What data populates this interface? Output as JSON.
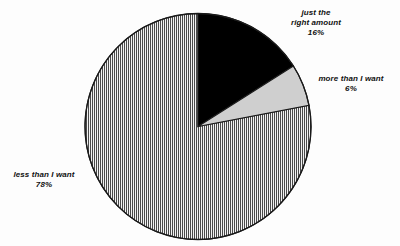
{
  "chart_data": {
    "type": "pie",
    "title": "",
    "subtitle": "",
    "xlabel": "",
    "ylabel": "",
    "legend_position": "none",
    "grid": false,
    "start_angle_deg": 0,
    "direction": "clockwise",
    "categories": [
      "just the right amount",
      "more than I want",
      "less than I want"
    ],
    "values": [
      16,
      6,
      78
    ],
    "units": "percent",
    "slices": [
      {
        "label": "just the right amount",
        "value": 16,
        "value_text": "16%",
        "fill": "solid-black",
        "color": "#000000",
        "start_deg": 0,
        "end_deg": 57.6
      },
      {
        "label": "more than I want",
        "value": 6,
        "value_text": "6%",
        "fill": "solid-light-gray",
        "color": "#cfcfcf",
        "start_deg": 57.6,
        "end_deg": 79.2
      },
      {
        "label": "less than I want",
        "value": 78,
        "value_text": "78%",
        "fill": "vertical-hatch",
        "color": "#4a4a4a",
        "start_deg": 79.2,
        "end_deg": 360
      }
    ]
  },
  "labels": {
    "just_right": {
      "line1": "just the",
      "line2": "right amount",
      "line3": "16%"
    },
    "more_than": {
      "line1": "more than I want",
      "line2": "6%"
    },
    "less_than": {
      "line1": "less than I want",
      "line2": "78%"
    }
  },
  "colors": {
    "background": "#fdfdfd",
    "outline": "#1a1a1a",
    "black_slice": "#000000",
    "gray_slice": "#cfcfcf",
    "hatch_line": "#4a4a4a",
    "hatch_gap": "#f2f2f2",
    "label_text": "#111111"
  },
  "geometry": {
    "center_x": 198,
    "center_y": 126.5,
    "radius": 113
  }
}
